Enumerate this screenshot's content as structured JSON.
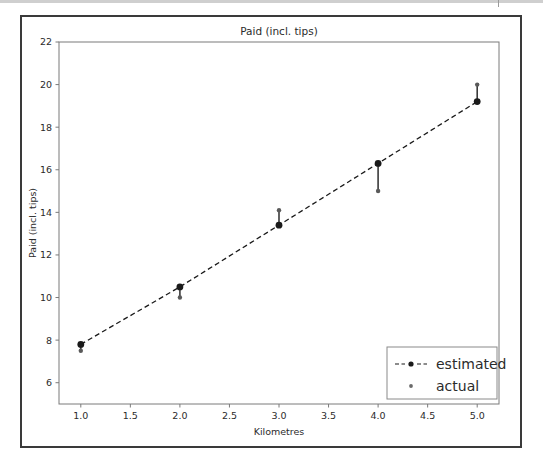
{
  "figure": {
    "title": "Paid (incl. tips)",
    "frame_color": "#3a3a3a",
    "background": "#ffffff"
  },
  "chart_data": {
    "type": "scatter",
    "title": "Paid (incl. tips)",
    "xlabel": "Kilometres",
    "ylabel": "Paid (incl. tips)",
    "xlim": [
      0.78,
      5.22
    ],
    "ylim": [
      5.0,
      22.0
    ],
    "xticks": [
      1.0,
      1.5,
      2.0,
      2.5,
      3.0,
      3.5,
      4.0,
      4.5,
      5.0
    ],
    "xtick_labels": [
      "1.0",
      "1.5",
      "2.0",
      "2.5",
      "3.0",
      "3.5",
      "4.0",
      "4.5",
      "5.0"
    ],
    "yticks": [
      6,
      8,
      10,
      12,
      14,
      16,
      18,
      20,
      22
    ],
    "ytick_labels": [
      "6",
      "8",
      "10",
      "12",
      "14",
      "16",
      "18",
      "20",
      "22"
    ],
    "grid": false,
    "legend_position": "lower right",
    "x": [
      1.0,
      2.0,
      3.0,
      4.0,
      5.0
    ],
    "series": [
      {
        "name": "estimated",
        "style": "dashed-line-with-markers",
        "color": "#1a1a1a",
        "values": [
          7.8,
          10.5,
          13.4,
          16.3,
          19.2
        ]
      },
      {
        "name": "actual",
        "style": "small-dot-markers",
        "color": "#5a5a5a",
        "values": [
          7.5,
          10.0,
          14.1,
          15.0,
          20.0
        ]
      }
    ],
    "connectors": [
      {
        "x": 1.0,
        "from": 7.8,
        "to": 7.5
      },
      {
        "x": 2.0,
        "from": 10.5,
        "to": 10.0
      },
      {
        "x": 3.0,
        "from": 13.4,
        "to": 14.1
      },
      {
        "x": 4.0,
        "from": 16.3,
        "to": 15.0
      },
      {
        "x": 5.0,
        "from": 19.2,
        "to": 20.0
      }
    ]
  },
  "legend": {
    "entries": [
      {
        "label": "estimated",
        "marker": "dashed-line-marker"
      },
      {
        "label": "actual",
        "marker": "dot-marker"
      }
    ]
  }
}
